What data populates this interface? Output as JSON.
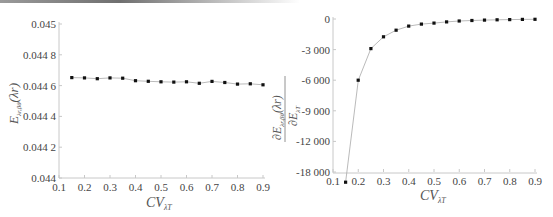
{
  "chart_data": [
    {
      "type": "line",
      "title": "",
      "xlabel": "CV_{λT}",
      "ylabel": "E_{λr,βθ}(λr)",
      "xlim": [
        0.1,
        0.9
      ],
      "ylim": [
        0.044,
        0.045
      ],
      "x_ticks": [
        "0.1",
        "0.2",
        "0.3",
        "0.4",
        "0.5",
        "0.6",
        "0.7",
        "0.8",
        "0.9"
      ],
      "y_ticks": [
        "0.044",
        "0.044 2",
        "0.044 4",
        "0.044 6",
        "0.044 8",
        "0.045"
      ],
      "grid": false,
      "x": [
        0.15,
        0.2,
        0.25,
        0.3,
        0.35,
        0.4,
        0.45,
        0.5,
        0.55,
        0.6,
        0.65,
        0.7,
        0.75,
        0.8,
        0.85,
        0.9
      ],
      "values": [
        0.044652,
        0.04465,
        0.044645,
        0.04465,
        0.044648,
        0.044632,
        0.044628,
        0.044625,
        0.044623,
        0.044625,
        0.044615,
        0.044627,
        0.04462,
        0.04461,
        0.044612,
        0.044605
      ]
    },
    {
      "type": "line",
      "title": "",
      "xlabel": "CV_{λT}",
      "ylabel": "∂E_{λr,βθ}(λr) / ∂E_{λT}",
      "xlim": [
        0.1,
        0.9
      ],
      "ylim": [
        -15000,
        0
      ],
      "x_ticks": [
        "0.1",
        "0.2",
        "0.3",
        "0.4",
        "0.5",
        "0.6",
        "0.7",
        "0.8",
        "0.9"
      ],
      "y_ticks": [
        "-18 000",
        "-12 000",
        "-9 000",
        "-6 000",
        "-3 000",
        "0"
      ],
      "grid": false,
      "x": [
        0.15,
        0.2,
        0.25,
        0.3,
        0.35,
        0.4,
        0.45,
        0.5,
        0.55,
        0.6,
        0.65,
        0.7,
        0.75,
        0.8,
        0.85,
        0.9
      ],
      "values": [
        -16000,
        -6000,
        -2900,
        -1750,
        -1100,
        -700,
        -500,
        -400,
        -280,
        -200,
        -150,
        -110,
        -80,
        -60,
        -40,
        -30
      ]
    }
  ],
  "left_chart": {
    "x_ticks": [
      "0.1",
      "0.2",
      "0.3",
      "0.4",
      "0.5",
      "0.6",
      "0.7",
      "0.8",
      "0.9"
    ],
    "y_ticks": [
      "0.045",
      "0.044 8",
      "0.044 6",
      "0.044 4",
      "0.044 2",
      "0.044"
    ],
    "xlabel_main": "CV",
    "xlabel_sub": "λT",
    "ylabel_main": "E",
    "ylabel_sub": "λr,βθ",
    "ylabel_arg": "(λr)"
  },
  "right_chart": {
    "x_ticks": [
      "0.1",
      "0.2",
      "0.3",
      "0.4",
      "0.5",
      "0.6",
      "0.7",
      "0.8",
      "0.9"
    ],
    "y_ticks": [
      "0",
      "-3 000",
      "-6 000",
      "-9 000",
      "-12 000",
      "-18 000"
    ],
    "xlabel_main": "CV",
    "xlabel_sub": "λT",
    "ylabel_num_main": "∂E",
    "ylabel_num_sub": "λr,βθ",
    "ylabel_num_arg": "(λr)",
    "ylabel_den_main": "∂E",
    "ylabel_den_sub": "λT"
  }
}
